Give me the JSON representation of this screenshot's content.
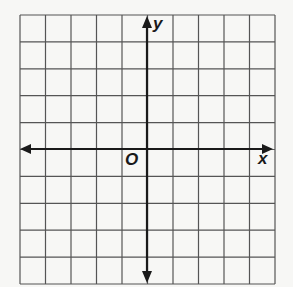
{
  "diagram": {
    "type": "coordinate-plane",
    "grid": {
      "columns": 10,
      "rows": 10,
      "line_color": "#555555",
      "background": "#f7f7f5"
    },
    "axes": {
      "color": "#1a1a1a",
      "x_label": "x",
      "y_label": "y",
      "origin_label": "O",
      "arrows": [
        "left",
        "right",
        "up",
        "down"
      ]
    }
  }
}
